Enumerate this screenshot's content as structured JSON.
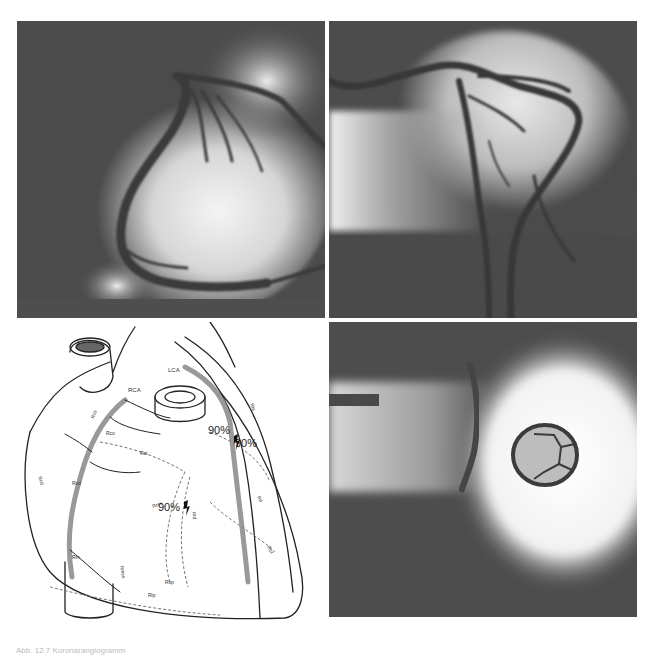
{
  "figure": {
    "panels": [
      {
        "id": "top-left",
        "type": "angiogram",
        "subject": "right coronary artery angiogram"
      },
      {
        "id": "top-right",
        "type": "angiogram",
        "subject": "left coronary artery angiogram"
      },
      {
        "id": "bottom-left",
        "type": "diagram",
        "subject": "heart schematic with coronary arteries"
      },
      {
        "id": "bottom-right",
        "type": "radiograph",
        "subject": "prosthetic valve ring"
      }
    ],
    "diagram_labels": {
      "rca": "RCA",
      "lca": "LCA",
      "rcs": "Rcs",
      "rco": "Rco",
      "rct": "Rct",
      "rcd": "Rcd",
      "rvd": "Rvd",
      "rm": "Rm",
      "rpd": "Rpd",
      "rip": "Rip",
      "rsp": "Rsp",
      "rcx": "Rcx",
      "rla": "Rla",
      "rid": "Rid",
      "rms": "Rms",
      "rmcs": "Rmcs",
      "rd": "Rd",
      "stenosis_1": "90%",
      "stenosis_2": "90%",
      "stenosis_3": "90%"
    },
    "caption": "Abb. 12.7 Koronarangiogramm"
  }
}
